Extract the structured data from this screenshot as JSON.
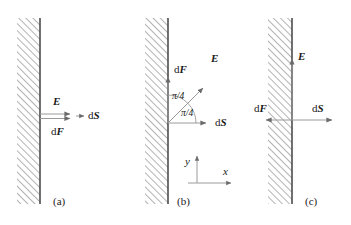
{
  "figure": {
    "background_color": "#ffffff",
    "line_color": "#808080",
    "wall_edge_color": "#4d4d4d",
    "hatch_color": "#737373",
    "text_color": "#1a1a1a",
    "width": 351,
    "height": 225
  },
  "panels": [
    {
      "id": "a",
      "caption": "(a)",
      "wall": {
        "x": 17,
        "y": 18,
        "width": 23,
        "height": 186
      },
      "labels": {
        "E": {
          "d": "",
          "sym": "E"
        },
        "dF": {
          "d": "d",
          "sym": "F"
        },
        "dS": {
          "d": "d",
          "sym": "S"
        }
      },
      "vectors": [
        {
          "name": "E",
          "from": [
            40,
            114
          ],
          "to": [
            72,
            114
          ],
          "label": "E"
        },
        {
          "name": "dF",
          "from": [
            40,
            118
          ],
          "to": [
            72,
            118
          ],
          "label": "dF"
        },
        {
          "name": "dS",
          "from": [
            76,
            116
          ],
          "to": [
            84,
            116
          ],
          "label": "dS"
        }
      ]
    },
    {
      "id": "b",
      "caption": "(b)",
      "wall": {
        "x": 145,
        "y": 18,
        "width": 23,
        "height": 186
      },
      "labels": {
        "E": {
          "d": "",
          "sym": "E"
        },
        "dF": {
          "d": "d",
          "sym": "F"
        },
        "dS": {
          "d": "d",
          "sym": "S"
        }
      },
      "angles": [
        {
          "value": "π/4",
          "between": "dF and E"
        },
        {
          "value": "π/4",
          "between": "E and dS"
        }
      ],
      "axes": {
        "x_label": "x",
        "y_label": "y",
        "origin": [
          197,
          183
        ]
      },
      "vectors": [
        {
          "name": "dF",
          "from": [
            168,
            123
          ],
          "to": [
            168,
            75
          ],
          "label": "dF"
        },
        {
          "name": "E",
          "from": [
            168,
            123
          ],
          "to": [
            205,
            87
          ],
          "label": "E"
        },
        {
          "name": "dS",
          "from": [
            168,
            123
          ],
          "to": [
            209,
            123
          ],
          "label": "dS"
        }
      ]
    },
    {
      "id": "c",
      "caption": "(c)",
      "wall": {
        "x": 268,
        "y": 18,
        "width": 24,
        "height": 186
      },
      "labels": {
        "E": {
          "d": "",
          "sym": "E"
        },
        "dF": {
          "d": "d",
          "sym": "F"
        },
        "dS": {
          "d": "d",
          "sym": "S"
        }
      },
      "vectors": [
        {
          "name": "E",
          "from": [
            292,
            120
          ],
          "to": [
            292,
            57
          ],
          "label": "E"
        },
        {
          "name": "dF",
          "from": [
            292,
            120
          ],
          "to": [
            264,
            120
          ],
          "label": "dF"
        },
        {
          "name": "dS",
          "from": [
            292,
            120
          ],
          "to": [
            334,
            120
          ],
          "label": "dS"
        }
      ]
    }
  ]
}
